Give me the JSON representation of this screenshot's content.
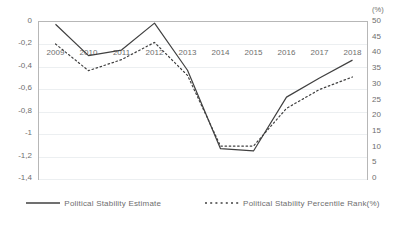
{
  "chart_data": {
    "type": "line",
    "title": "",
    "xlabel": "",
    "ylabel": "",
    "grid": true,
    "legend_position": "bottom",
    "categories": [
      "2009",
      "2010",
      "2011",
      "2012",
      "2013",
      "2014",
      "2015",
      "2016",
      "2017",
      "2018"
    ],
    "left_axis": {
      "ticks": [
        "0",
        "-0,2",
        "-0,4",
        "-0,6",
        "-0,8",
        "-1",
        "-1,2",
        "-1,4"
      ],
      "tick_values": [
        0,
        -0.2,
        -0.4,
        -0.6,
        -0.8,
        -1,
        -1.2,
        -1.4
      ],
      "ylim": [
        -1.4,
        0
      ]
    },
    "right_axis": {
      "unit_label": "(%)",
      "ticks": [
        "50",
        "45",
        "40",
        "35",
        "30",
        "25",
        "20",
        "15",
        "10",
        "5",
        "0"
      ],
      "tick_values": [
        50,
        45,
        40,
        35,
        30,
        25,
        20,
        15,
        10,
        5,
        0
      ],
      "ylim": [
        0,
        50
      ]
    },
    "series": [
      {
        "name": "Political Stability Estimate",
        "axis": "left",
        "style": "solid",
        "color": "#404040",
        "values": [
          -0.02,
          -0.3,
          -0.25,
          -0.01,
          -0.43,
          -1.13,
          -1.15,
          -0.67,
          -0.5,
          -0.34
        ]
      },
      {
        "name": "Political Stability Percentile Rank(%)",
        "axis": "right",
        "style": "dotted",
        "color": "#404040",
        "values": [
          43.0,
          34.5,
          38.0,
          43.5,
          33.0,
          10.5,
          10.5,
          22.5,
          28.5,
          32.5
        ],
        "left_axis_equivalent": [
          -0.19,
          -0.41,
          -0.31,
          -0.17,
          -0.47,
          -1.08,
          -1.09,
          -0.74,
          -0.58,
          -0.48
        ]
      }
    ]
  },
  "legend": {
    "items": [
      {
        "label": "Political Stability Estimate",
        "swatch": "solid-line-swatch"
      },
      {
        "label": "Political Stability Percentile Rank(%)",
        "swatch": "dotted-line-swatch"
      }
    ]
  },
  "colors": {
    "series_line": "#404040",
    "frame": "#b7b7b7",
    "gridline": "#eceff1",
    "text": "#6e6e6e",
    "background": "#ffffff"
  }
}
